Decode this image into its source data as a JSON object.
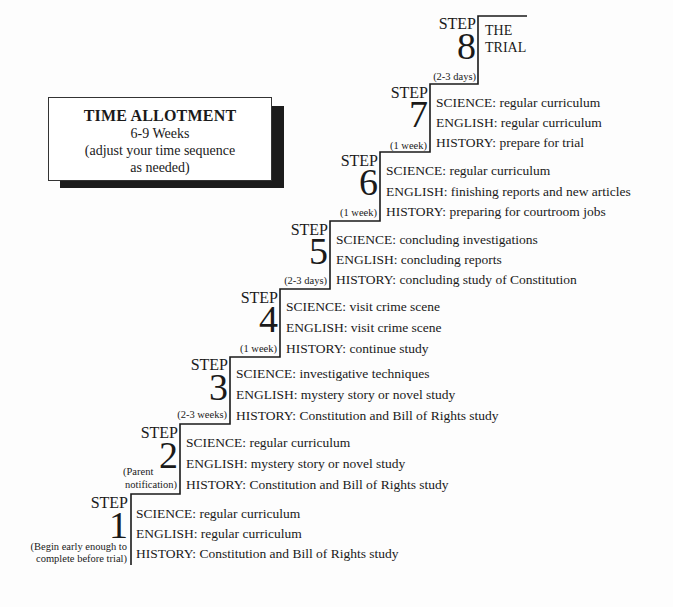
{
  "time_allotment": {
    "title": "TIME ALLOTMENT",
    "duration": "6-9 Weeks",
    "note_line1": "(adjust your time sequence",
    "note_line2": "as needed)"
  },
  "steps": [
    {
      "label": "STEP",
      "number": "1",
      "duration_note_1": "(Begin early enough to",
      "duration_note_2": "complete before trial)",
      "science": "SCIENCE: regular curriculum",
      "english": "ENGLISH: regular curriculum",
      "history": "HISTORY: Constitution and Bill of Rights study"
    },
    {
      "label": "STEP",
      "number": "2",
      "duration_note_1": "(Parent",
      "duration_note_2": "notification)",
      "science": "SCIENCE: regular curriculum",
      "english": "ENGLISH: mystery story or novel study",
      "history": "HISTORY: Constitution and Bill of Rights study"
    },
    {
      "label": "STEP",
      "number": "3",
      "duration": "(2-3 weeks)",
      "science": "SCIENCE: investigative techniques",
      "english": "ENGLISH: mystery story or novel study",
      "history": "HISTORY: Constitution and Bill of Rights study"
    },
    {
      "label": "STEP",
      "number": "4",
      "duration": "(1 week)",
      "science": "SCIENCE: visit crime scene",
      "english": "ENGLISH: visit crime scene",
      "history": "HISTORY: continue study"
    },
    {
      "label": "STEP",
      "number": "5",
      "duration": "(2-3 days)",
      "science": "SCIENCE: concluding investigations",
      "english": "ENGLISH: concluding reports",
      "history": "HISTORY: concluding study of Constitution"
    },
    {
      "label": "STEP",
      "number": "6",
      "duration": "(1 week)",
      "science": "SCIENCE: regular curriculum",
      "english": "ENGLISH: finishing reports and new articles",
      "history": "HISTORY: preparing for courtroom jobs"
    },
    {
      "label": "STEP",
      "number": "7",
      "duration": "(1 week)",
      "science": "SCIENCE: regular curriculum",
      "english": "ENGLISH: regular curriculum",
      "history": "HISTORY: prepare for trial"
    },
    {
      "label": "STEP",
      "number": "8",
      "duration": "(2-3 days)",
      "title_line1": "THE",
      "title_line2": "TRIAL"
    }
  ]
}
